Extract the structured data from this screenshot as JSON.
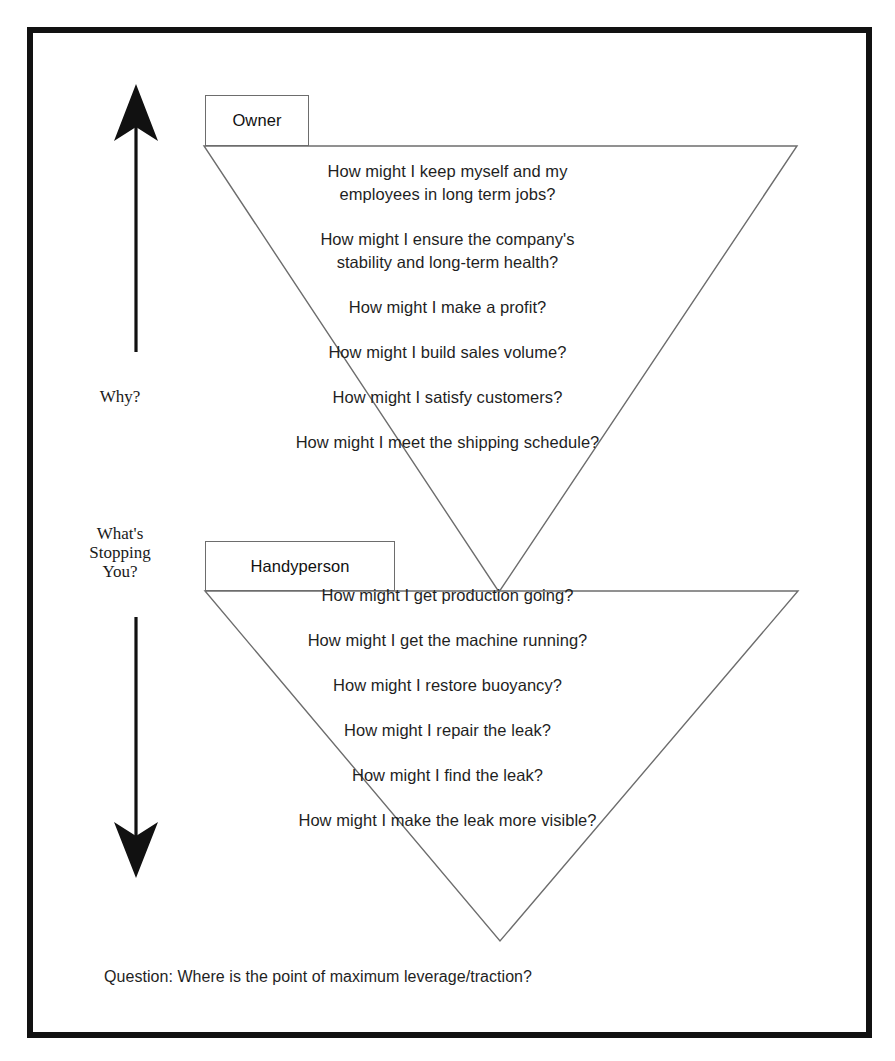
{
  "diagram": {
    "axis": {
      "up_label": "Why?",
      "down_label": "What's\nStopping\nYou?",
      "up_arrow_icon": "arrow-up-icon",
      "down_arrow_icon": "arrow-down-icon"
    },
    "colors": {
      "frame": "#111111",
      "triangle_stroke": "#6d6d6d",
      "box_stroke": "#6d6d6d",
      "text": "#1f1f1f",
      "background": "#ffffff"
    },
    "upper": {
      "role": "Owner",
      "questions": [
        "How might I keep myself and my",
        "employees in long term jobs?",
        "How might I ensure the company's",
        "stability and long-term health?",
        "How might I make a profit?",
        "How might I build sales volume?",
        "How might I satisfy customers?",
        "How might I meet the shipping schedule?"
      ]
    },
    "lower": {
      "role": "Handyperson",
      "questions": [
        "How might I get production going?",
        "How might I get the machine running?",
        "How might I restore buoyancy?",
        "How might I repair the leak?",
        "How might I find the leak?",
        "How might I make the leak more visible?"
      ]
    },
    "footer": {
      "question": "Question: Where is the point of maximum leverage/traction?"
    }
  }
}
